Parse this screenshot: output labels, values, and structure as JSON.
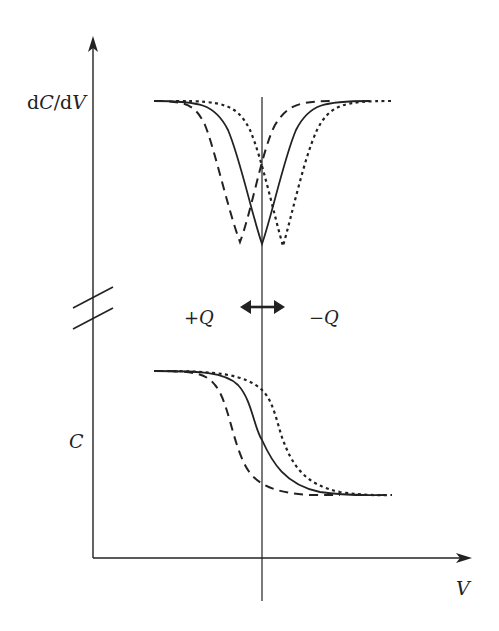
{
  "diagram": {
    "type": "schematic-plot",
    "y_axis_labels": {
      "upper_prefix": "d",
      "upper_var1": "C",
      "upper_slash": "/d",
      "upper_var2": "V",
      "lower": "C"
    },
    "x_axis_label": "V",
    "annotations": {
      "left_charge": "+Q",
      "right_charge": "−Q",
      "shift_arrow": "double-headed horizontal arrow"
    },
    "axis_break": "two parallel diagonal break marks on vertical axis",
    "colors": {
      "ink": "#222222",
      "background": "#ffffff"
    },
    "series": [
      {
        "name": "dashed (+Q shift)",
        "style": "dashed",
        "center_x": 240
      },
      {
        "name": "solid (neutral)",
        "style": "solid",
        "center_x": 262
      },
      {
        "name": "dotted (−Q shift)",
        "style": "dotted",
        "center_x": 283
      }
    ],
    "panels": {
      "upper": {
        "quantity": "dC/dV",
        "shape": "inverted peak (dip)",
        "baseline_y": 101,
        "min_y": 244
      },
      "lower": {
        "quantity": "C",
        "shape": "descending sigmoid",
        "top_y": 371,
        "bottom_y": 495
      }
    }
  }
}
